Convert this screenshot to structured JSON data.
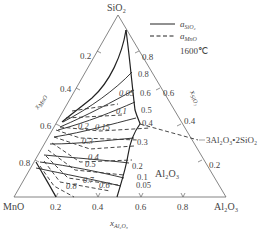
{
  "diagram": {
    "type": "ternary-phase-diagram",
    "vertices": {
      "top": "SiO₂",
      "left": "MnO",
      "right": "Al₂O₃"
    },
    "axes": {
      "left": {
        "label": "x",
        "label_sub": "MnO",
        "ticks": [
          "0.2",
          "0.4",
          "0.6",
          "0.8"
        ]
      },
      "right": {
        "label": "x",
        "label_sub": "SiO₂",
        "ticks": [
          "0.8",
          "0.6",
          "0.4",
          "0.2"
        ]
      },
      "bottom": {
        "label": "x",
        "label_sub": "Al₂O₃",
        "ticks": [
          "0.2",
          "0.4",
          "0.6",
          "0.8"
        ]
      }
    },
    "legend": {
      "solid": {
        "label": "a",
        "sub": "SiO₂"
      },
      "dashed": {
        "label": "a",
        "sub": "MnO"
      },
      "temperature": "1600℃"
    },
    "phase_labels": {
      "mullite": "3Al₂O₃•2SiO₂",
      "alumina": "Al₂O₃"
    },
    "solid_iso_labels": [
      "0.8",
      "0.6",
      "0.5",
      "0.4",
      "0.3",
      "0.2",
      "0.1",
      "0.05"
    ],
    "dashed_iso_labels": [
      "0.05",
      "0.1",
      "0.15",
      "0.2",
      "0.3",
      "0.4",
      "0.5",
      "0.6",
      "0.7",
      "0.8"
    ]
  }
}
